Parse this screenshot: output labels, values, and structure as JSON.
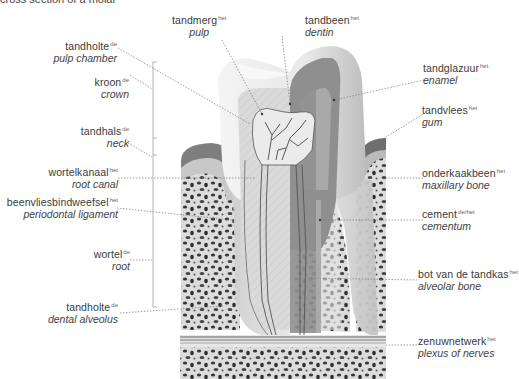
{
  "caption": "cross section of a molar",
  "colors": {
    "enamel": "#e9e9e9",
    "dentin": "#8c8c8c",
    "pulp": "#d7d7d7",
    "gum": "#7a7a7a",
    "bone_bg": "#dedede",
    "bone_spots": "#3a3a3a",
    "leader": "#777777"
  },
  "labels": {
    "tandmerg": {
      "nl": "tandmerg",
      "gender": "het",
      "en": "pulp"
    },
    "tandbeen": {
      "nl": "tandbeen",
      "gender": "het",
      "en": "dentin"
    },
    "tandholte_top": {
      "nl": "tandholte",
      "gender": "de",
      "en": "pulp chamber"
    },
    "kroon": {
      "nl": "kroon",
      "gender": "de",
      "en": "crown"
    },
    "tandhals": {
      "nl": "tandhals",
      "gender": "de",
      "en": "neck"
    },
    "wortelkanaal": {
      "nl": "wortelkanaal",
      "gender": "het",
      "en": "root canal"
    },
    "beenvlies": {
      "nl": "beenvliesbindweefsel",
      "gender": "het",
      "en": "periodontal ligament"
    },
    "wortel": {
      "nl": "wortel",
      "gender": "de",
      "en": "root"
    },
    "tandholte_bottom": {
      "nl": "tandholte",
      "gender": "de",
      "en": "dental alveolus"
    },
    "tandglazuur": {
      "nl": "tandglazuur",
      "gender": "het",
      "en": "enamel"
    },
    "tandvlees": {
      "nl": "tandvlees",
      "gender": "het",
      "en": "gum"
    },
    "onderkaakbeen": {
      "nl": "onderkaakbeen",
      "gender": "het",
      "en": "maxillary bone"
    },
    "cement": {
      "nl": "cement",
      "gender": "de/het",
      "en": "cementum"
    },
    "bot": {
      "nl": "bot van de tandkas",
      "gender": "het",
      "en": "alveolar bone"
    },
    "zenuwnetwerk": {
      "nl": "zenuwnetwerk",
      "gender": "het",
      "en": "plexus of nerves"
    }
  }
}
